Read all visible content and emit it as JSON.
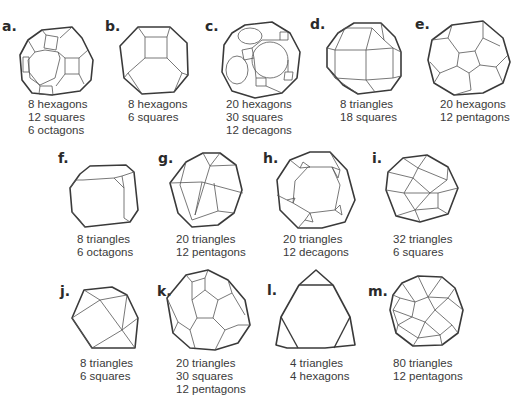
{
  "figures": [
    {
      "id": "a",
      "label": "a.",
      "faces": [
        "8 hexagons",
        "12 squares",
        "6 octagons"
      ]
    },
    {
      "id": "b",
      "label": "b.",
      "faces": [
        "8 hexagons",
        "6 squares"
      ]
    },
    {
      "id": "c",
      "label": "c.",
      "faces": [
        "20 hexagons",
        "30 squares",
        "12 decagons"
      ]
    },
    {
      "id": "d",
      "label": "d.",
      "faces": [
        "8 triangles",
        "18 squares"
      ]
    },
    {
      "id": "e",
      "label": "e.",
      "faces": [
        "20 hexagons",
        "12 pentagons"
      ]
    },
    {
      "id": "f",
      "label": "f.",
      "faces": [
        "8 triangles",
        "6 octagons"
      ]
    },
    {
      "id": "g",
      "label": "g.",
      "faces": [
        "20 triangles",
        "12 pentagons"
      ]
    },
    {
      "id": "h",
      "label": "h.",
      "faces": [
        "20 triangles",
        "12 decagons"
      ]
    },
    {
      "id": "i",
      "label": "i.",
      "faces": [
        "32 triangles",
        "6 squares"
      ]
    },
    {
      "id": "j",
      "label": "j.",
      "faces": [
        "8 triangles",
        "6 squares"
      ]
    },
    {
      "id": "k",
      "label": "k.",
      "faces": [
        "20 triangles",
        "30 squares",
        "12 pentagons"
      ]
    },
    {
      "id": "l",
      "label": "l.",
      "faces": [
        "4 triangles",
        "4 hexagons"
      ]
    },
    {
      "id": "m",
      "label": "m.",
      "faces": [
        "80 triangles",
        "12 pentagons"
      ]
    }
  ],
  "colors": {
    "background": "#ffffff",
    "stroke": "#3a3a3a",
    "text": "#3a3a3a"
  }
}
